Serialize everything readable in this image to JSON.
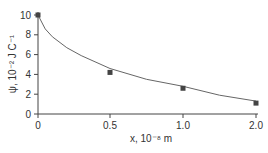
{
  "chart_data": {
    "type": "scatter",
    "title": "",
    "xlabel": "x, 10⁻⁸ m",
    "ylabel": "ψ, 10⁻² J C⁻¹",
    "x_ticks": [
      "0",
      "0.5",
      "1.0",
      "2.0"
    ],
    "y_ticks": [
      "0",
      "2",
      "4",
      "6",
      "8",
      "10"
    ],
    "ylim": [
      0,
      10
    ],
    "grid": false,
    "legend": null,
    "series": [
      {
        "name": "measured",
        "marker": "square",
        "x": [
          0,
          0.5,
          1.0,
          2.0
        ],
        "y": [
          10,
          4.2,
          2.6,
          1.1
        ]
      },
      {
        "name": "fit curve",
        "style": "line",
        "x": [
          0,
          0.05,
          0.1,
          0.2,
          0.3,
          0.5,
          0.75,
          1.0,
          1.5,
          2.0
        ],
        "y": [
          10,
          8.6,
          7.8,
          6.7,
          5.9,
          4.6,
          3.5,
          2.8,
          1.9,
          1.3
        ]
      }
    ]
  }
}
